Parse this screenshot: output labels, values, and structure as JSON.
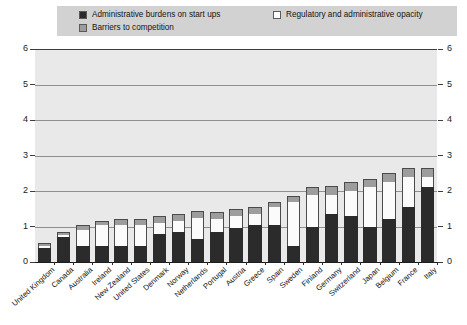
{
  "legend": {
    "items": [
      {
        "label": "Administrative burdens on start ups",
        "color": "#2b2b2b",
        "key": "administrative_burdens"
      },
      {
        "label": "Barriers to competition",
        "color": "#9d9d9d",
        "key": "barriers_to_competition"
      },
      {
        "label": "Regulatory and administrative opacity",
        "color": "#fbfbfb",
        "key": "regulatory_opacity"
      }
    ]
  },
  "axis": {
    "y_ticks": [
      "0",
      "1",
      "2",
      "3",
      "4",
      "5",
      "6"
    ],
    "y_ticks_right": [
      "0",
      "1",
      "2",
      "3",
      "4",
      "5",
      "6"
    ]
  },
  "chart_data": {
    "type": "bar",
    "title": "",
    "subtitle": "",
    "xlabel": "",
    "ylabel": "",
    "ylim": [
      0,
      6
    ],
    "grid": true,
    "stacked": true,
    "legend_position": "top",
    "categories": [
      "United Kingdom",
      "Canada",
      "Australia",
      "Ireland",
      "New Zealand",
      "United States",
      "Denmark",
      "Norway",
      "Netherlands",
      "Portugal",
      "Austria",
      "Greece",
      "Spain",
      "Sweden",
      "Finland",
      "Germany",
      "Switzerland",
      "Japan",
      "Belgium",
      "France",
      "Italy"
    ],
    "series": [
      {
        "name": "Administrative burdens on start ups",
        "color": "#2b2b2b",
        "values": [
          0.4,
          0.7,
          0.45,
          0.45,
          0.45,
          0.45,
          0.8,
          0.85,
          0.65,
          0.85,
          0.95,
          1.05,
          1.05,
          0.45,
          1.0,
          1.35,
          1.3,
          1.0,
          1.2,
          1.55,
          2.1
        ]
      },
      {
        "name": "Regulatory and administrative opacity",
        "color": "#fbfbfb",
        "values": [
          0.05,
          0.05,
          0.45,
          0.6,
          0.6,
          0.6,
          0.3,
          0.3,
          0.6,
          0.35,
          0.35,
          0.3,
          0.5,
          1.25,
          0.9,
          0.55,
          0.7,
          1.1,
          1.05,
          0.85,
          0.3
        ]
      },
      {
        "name": "Barriers to competition",
        "color": "#9d9d9d",
        "values": [
          0.1,
          0.1,
          0.15,
          0.1,
          0.15,
          0.15,
          0.2,
          0.2,
          0.2,
          0.2,
          0.2,
          0.2,
          0.15,
          0.15,
          0.2,
          0.25,
          0.25,
          0.25,
          0.25,
          0.25,
          0.25
        ]
      }
    ],
    "totals": [
      0.55,
      0.85,
      1.05,
      1.15,
      1.2,
      1.2,
      1.3,
      1.35,
      1.45,
      1.4,
      1.5,
      1.55,
      1.7,
      1.85,
      2.1,
      2.15,
      2.25,
      2.35,
      2.5,
      2.65,
      2.65
    ]
  }
}
